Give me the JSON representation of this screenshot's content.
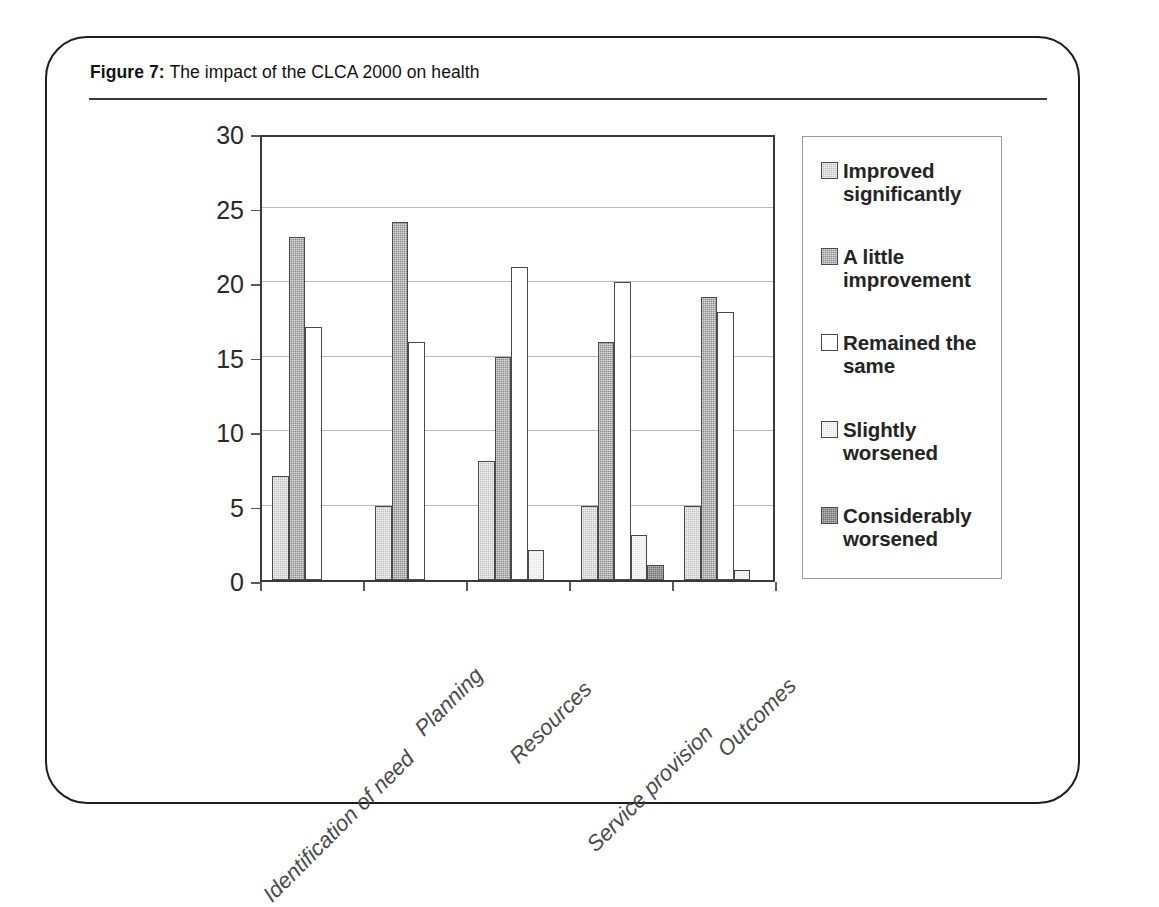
{
  "figure": {
    "label": "Figure 7:",
    "caption": "The impact of the CLCA 2000 on health"
  },
  "chart_data": {
    "type": "bar",
    "title": "The impact of the CLCA 2000 on health",
    "xlabel": "",
    "ylabel": "No. of responses",
    "ylim": [
      0,
      30
    ],
    "yticks": [
      0,
      5,
      10,
      15,
      20,
      25,
      30
    ],
    "grid": true,
    "legend_position": "right",
    "categories": [
      "Identification of need",
      "Planning",
      "Resources",
      "Service provision",
      "Outcomes"
    ],
    "series": [
      {
        "name": "Improved significantly",
        "color": "#bdbdbd",
        "values": [
          7,
          5,
          8,
          5,
          5
        ]
      },
      {
        "name": "A little improvement",
        "color": "#8c8c8c",
        "values": [
          23,
          24,
          15,
          16,
          19
        ]
      },
      {
        "name": "Remained the same",
        "color": "#ffffff",
        "values": [
          17,
          16,
          21,
          20,
          18
        ]
      },
      {
        "name": "Slightly worsened",
        "color": "#e4e4e4",
        "values": [
          0,
          0,
          2,
          3,
          0.7
        ]
      },
      {
        "name": "Considerably worsened",
        "color": "#6e6e6e",
        "values": [
          0,
          0,
          0,
          1,
          0
        ]
      }
    ]
  },
  "legend": {
    "entries": [
      {
        "label": "Improved significantly"
      },
      {
        "label": "A little improvement"
      },
      {
        "label": "Remained the same"
      },
      {
        "label": "Slightly worsened"
      },
      {
        "label": "Considerably worsened"
      }
    ]
  }
}
